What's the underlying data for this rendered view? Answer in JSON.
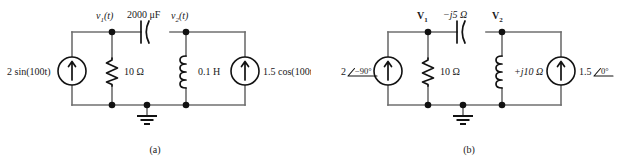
{
  "figure": {
    "background": "#ffffff",
    "wire_color": "#6f6f6f",
    "component_color": "#121212"
  },
  "circuit_a": {
    "caption": "(a)",
    "node1_label": "v",
    "node1_sub": "1",
    "node1_arg": "(t)",
    "node2_label": "v",
    "node2_sub": "2",
    "node2_arg": "(t)",
    "capacitor_label": "2000 μF",
    "resistor_label": "10 Ω",
    "inductor_label": "0.1 H",
    "source_left_label": "2 sin(100t)",
    "source_right_label": "1.5 cos(100t)"
  },
  "circuit_b": {
    "caption": "(b)",
    "node1_label": "V",
    "node1_sub": "1",
    "node2_label": "V",
    "node2_sub": "2",
    "capacitor_label": "−j5 Ω",
    "resistor_label": "10 Ω",
    "inductor_label": "+j10 Ω",
    "source_left_mag": "2",
    "source_left_angle": "−90°",
    "source_right_mag": "1.5",
    "source_right_angle": "0°"
  }
}
